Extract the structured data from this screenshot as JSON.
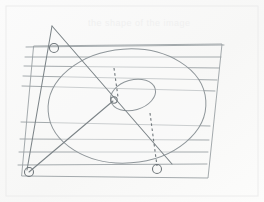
{
  "figure": {
    "caption_faded": "the shape of the image",
    "background_color": "#fdfdfd",
    "ink_color": "#9aa0a4",
    "ink_color_dark": "#7b8387",
    "frame_color": "#e8e8e8",
    "plane": {
      "name": "ruled-plane",
      "label": "inclined plane in perspective",
      "corners": [
        [
          34,
          46
        ],
        [
          222,
          44
        ],
        [
          208,
          178
        ],
        [
          22,
          176
        ]
      ],
      "rule_line_count": 9,
      "rule_lines": [
        {
          "x1": 26,
          "y1": 47,
          "x2": 224,
          "y2": 45
        },
        {
          "x1": 25,
          "y1": 57,
          "x2": 221,
          "y2": 57
        },
        {
          "x1": 24,
          "y1": 66,
          "x2": 219,
          "y2": 68
        },
        {
          "x1": 23,
          "y1": 76,
          "x2": 217,
          "y2": 80
        },
        {
          "x1": 22,
          "y1": 86,
          "x2": 215,
          "y2": 91
        },
        {
          "x1": 21,
          "y1": 122,
          "x2": 210,
          "y2": 126
        },
        {
          "x1": 20,
          "y1": 139,
          "x2": 209,
          "y2": 140
        },
        {
          "x1": 19,
          "y1": 152,
          "x2": 208,
          "y2": 152
        },
        {
          "x1": 18,
          "y1": 165,
          "x2": 207,
          "y2": 164
        }
      ]
    },
    "major_ellipse": {
      "name": "circle-in-perspective",
      "label": "projected circle",
      "cx": 127,
      "cy": 106,
      "rx": 79,
      "ry": 57,
      "rotation": -4
    },
    "minor_ellipse": {
      "name": "inner-ellipse",
      "label": "small projected circle at centre",
      "cx": 133,
      "cy": 95,
      "rx": 23,
      "ry": 15,
      "rotation": -16
    },
    "center_point": {
      "name": "centre-node",
      "x": 113,
      "y": 101
    },
    "construction_lines": [
      {
        "name": "main-diagonal",
        "x1": 52,
        "y1": 26,
        "x2": 172,
        "y2": 164,
        "style": "solid"
      },
      {
        "name": "secondary-diagonal",
        "x1": 113,
        "y1": 101,
        "x2": 29,
        "y2": 172,
        "style": "solid"
      },
      {
        "name": "left-edge-line",
        "x1": 52,
        "y1": 26,
        "x2": 27,
        "y2": 170,
        "style": "solid"
      }
    ],
    "dashed_lines": [
      {
        "name": "upper-projector",
        "x1": 114,
        "y1": 68,
        "x2": 118,
        "y2": 97,
        "style": "dashed"
      },
      {
        "name": "lower-projector",
        "x1": 150,
        "y1": 113,
        "x2": 157,
        "y2": 166,
        "style": "dashed"
      }
    ],
    "node_markers": [
      {
        "name": "node-top-left",
        "x": 54,
        "y": 48,
        "r": 4.5
      },
      {
        "name": "node-bottom-left",
        "x": 29,
        "y": 172,
        "r": 4.5
      },
      {
        "name": "node-bottom-mid",
        "x": 157,
        "y": 169,
        "r": 4.5
      },
      {
        "name": "node-centre",
        "x": 114,
        "y": 100,
        "r": 3.2
      }
    ]
  }
}
